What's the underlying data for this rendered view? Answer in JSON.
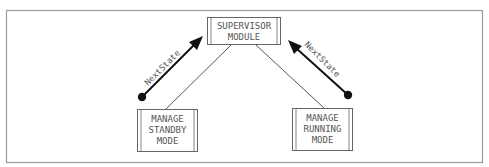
{
  "diagram": {
    "frame": {
      "x": 6,
      "y": 10,
      "width": 476,
      "height": 152,
      "stroke": "#9a9a9a"
    },
    "colors": {
      "box_stroke": "#666666",
      "line": "#444444",
      "arrow": "#111111",
      "text": "#555555"
    },
    "nodes": [
      {
        "id": "supervisor",
        "lines": [
          "SUPERVISOR",
          "MODULE"
        ],
        "x": 207,
        "y": 17,
        "width": 73,
        "height": 27
      },
      {
        "id": "standby",
        "lines": [
          "MANAGE",
          "STANDBY",
          "MODE"
        ],
        "x": 137,
        "y": 109,
        "width": 60,
        "height": 42
      },
      {
        "id": "running",
        "lines": [
          "MANAGE",
          "RUNNING",
          "MODE"
        ],
        "x": 292,
        "y": 108,
        "width": 60,
        "height": 42
      }
    ],
    "edges": [
      {
        "from": "supervisor",
        "to": "standby",
        "x1": 231,
        "y1": 45,
        "x2": 166,
        "y2": 109
      },
      {
        "from": "supervisor",
        "to": "running",
        "x1": 256,
        "y1": 45,
        "x2": 324,
        "y2": 108
      }
    ],
    "flows": [
      {
        "label": "NextState",
        "from": "standby",
        "to": "supervisor",
        "dot": [
          142,
          97
        ],
        "tip": [
          203,
          36
        ]
      },
      {
        "label": "NextState",
        "from": "running",
        "to": "supervisor",
        "dot": [
          348,
          95
        ],
        "tip": [
          288,
          40
        ]
      }
    ]
  }
}
